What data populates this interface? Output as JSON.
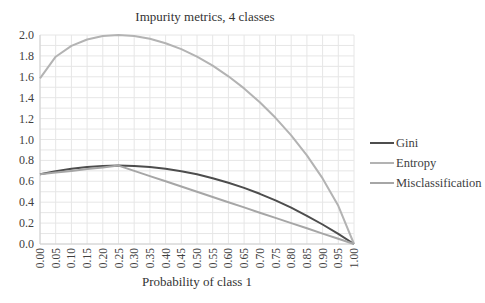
{
  "chart_data": {
    "type": "line",
    "title": "Impurity metrics, 4 classes",
    "xlabel": "Probability of class 1",
    "ylabel": "",
    "x": [
      0.0,
      0.05,
      0.1,
      0.15,
      0.2,
      0.25,
      0.3,
      0.35,
      0.4,
      0.45,
      0.5,
      0.55,
      0.6,
      0.65,
      0.7,
      0.75,
      0.8,
      0.85,
      0.9,
      0.95,
      1.0
    ],
    "x_tick_labels": [
      "0.00",
      "0.05",
      "0.10",
      "0.15",
      "0.20",
      "0.25",
      "0.30",
      "0.35",
      "0.40",
      "0.45",
      "0.50",
      "0.55",
      "0.60",
      "0.65",
      "0.70",
      "0.75",
      "0.80",
      "0.85",
      "0.90",
      "0.95",
      "1.00"
    ],
    "y_tick_labels": [
      "0.0",
      "0.2",
      "0.4",
      "0.6",
      "0.8",
      "1.0",
      "1.2",
      "1.4",
      "1.6",
      "1.8",
      "2.0"
    ],
    "ylim": [
      0,
      2.0
    ],
    "xlim": [
      0,
      1.0
    ],
    "grid": true,
    "legend_position": "right",
    "series": [
      {
        "name": "Gini",
        "color": "#4d4d4d",
        "values": [
          0.667,
          0.697,
          0.72,
          0.737,
          0.747,
          0.75,
          0.747,
          0.737,
          0.72,
          0.697,
          0.667,
          0.63,
          0.587,
          0.537,
          0.48,
          0.417,
          0.347,
          0.27,
          0.187,
          0.097,
          0.0
        ]
      },
      {
        "name": "Entropy",
        "color": "#b3b3b3",
        "values": [
          1.585,
          1.792,
          1.896,
          1.957,
          1.99,
          2.0,
          1.991,
          1.964,
          1.922,
          1.865,
          1.792,
          1.706,
          1.605,
          1.489,
          1.357,
          1.208,
          1.039,
          0.848,
          0.628,
          0.366,
          0.0
        ]
      },
      {
        "name": "Misclassification",
        "color": "#a6a6a6",
        "values": [
          0.667,
          0.683,
          0.7,
          0.717,
          0.733,
          0.75,
          0.7,
          0.65,
          0.6,
          0.55,
          0.5,
          0.45,
          0.4,
          0.35,
          0.3,
          0.25,
          0.2,
          0.15,
          0.1,
          0.05,
          0.0
        ]
      }
    ]
  },
  "legend": {
    "items": [
      {
        "label": "Gini",
        "color": "#4d4d4d"
      },
      {
        "label": "Entropy",
        "color": "#b3b3b3"
      },
      {
        "label": "Misclassification",
        "color": "#a6a6a6"
      }
    ]
  },
  "colors": {
    "grid": "#e6e6e6",
    "axis": "#d0d0d0",
    "text": "#404040"
  }
}
